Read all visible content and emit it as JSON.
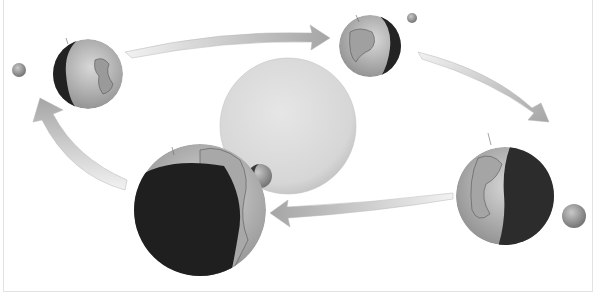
{
  "diagram": {
    "sun": {
      "cx": 288,
      "cy": 126,
      "r": 68,
      "color": "#d9d9d9"
    },
    "earths": [
      {
        "name": "earth-left",
        "cx": 88,
        "cy": 74,
        "r": 35,
        "dark_side": "left"
      },
      {
        "name": "earth-top",
        "cx": 370,
        "cy": 46,
        "r": 31,
        "dark_side": "right"
      },
      {
        "name": "earth-right",
        "cx": 505,
        "cy": 196,
        "r": 49,
        "dark_side": "right"
      },
      {
        "name": "earth-front",
        "cx": 200,
        "cy": 210,
        "r": 66,
        "dark_side": "left"
      }
    ],
    "moons": [
      {
        "name": "moon-left",
        "cx": 19,
        "cy": 70,
        "r": 7
      },
      {
        "name": "moon-top",
        "cx": 412,
        "cy": 18,
        "r": 5
      },
      {
        "name": "moon-right",
        "cx": 574,
        "cy": 216,
        "r": 12
      },
      {
        "name": "moon-front",
        "cx": 260,
        "cy": 176,
        "r": 12
      }
    ],
    "arrows": [
      {
        "name": "arrow-top",
        "direction": "left-to-right"
      },
      {
        "name": "arrow-right",
        "direction": "down-right"
      },
      {
        "name": "arrow-bottom",
        "direction": "right-to-left"
      },
      {
        "name": "arrow-left",
        "direction": "up"
      }
    ],
    "colors": {
      "arrow_light": "#ececec",
      "arrow_dark": "#a8a8a8",
      "earth_light": "#c8c8c8",
      "earth_dark": "#333333"
    }
  }
}
